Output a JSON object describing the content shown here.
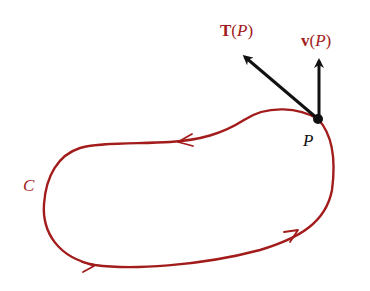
{
  "diagram": {
    "curve": {
      "name": "C",
      "label": "C",
      "color": "#a31c1c",
      "orientation": "counterclockwise",
      "direction_arrows": 2
    },
    "point": {
      "label": "P",
      "color": "#111111"
    },
    "vectors": [
      {
        "id": "tangent",
        "symbol": "T",
        "arg_open": "(",
        "arg": "P",
        "arg_close": ")",
        "color": "#111111",
        "label_color": "#a31c1c",
        "direction": "up-left, along tangent"
      },
      {
        "id": "velocity",
        "symbol": "v",
        "arg_open": "(",
        "arg": "P",
        "arg_close": ")",
        "color": "#111111",
        "label_color": "#a31c1c",
        "direction": "straight up"
      }
    ]
  }
}
